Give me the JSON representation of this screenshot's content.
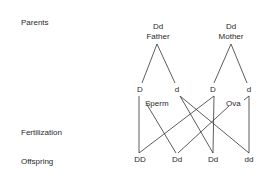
{
  "row_labels": {
    "parents": "Parents",
    "fertilization": "Fertilization",
    "offspring": "Offspring"
  },
  "parents": {
    "father": {
      "genotype": "Dd",
      "label": "Father"
    },
    "mother": {
      "genotype": "Dd",
      "label": "Mother"
    }
  },
  "gametes": {
    "father": [
      "D",
      "d"
    ],
    "mother": [
      "D",
      "d"
    ],
    "sperm_label": "Sperm",
    "ova_label": "Ova"
  },
  "offspring": [
    "DD",
    "Dd",
    "Dd",
    "dd"
  ],
  "colors": {
    "line": "#333333",
    "text": "#2a2a2a"
  }
}
